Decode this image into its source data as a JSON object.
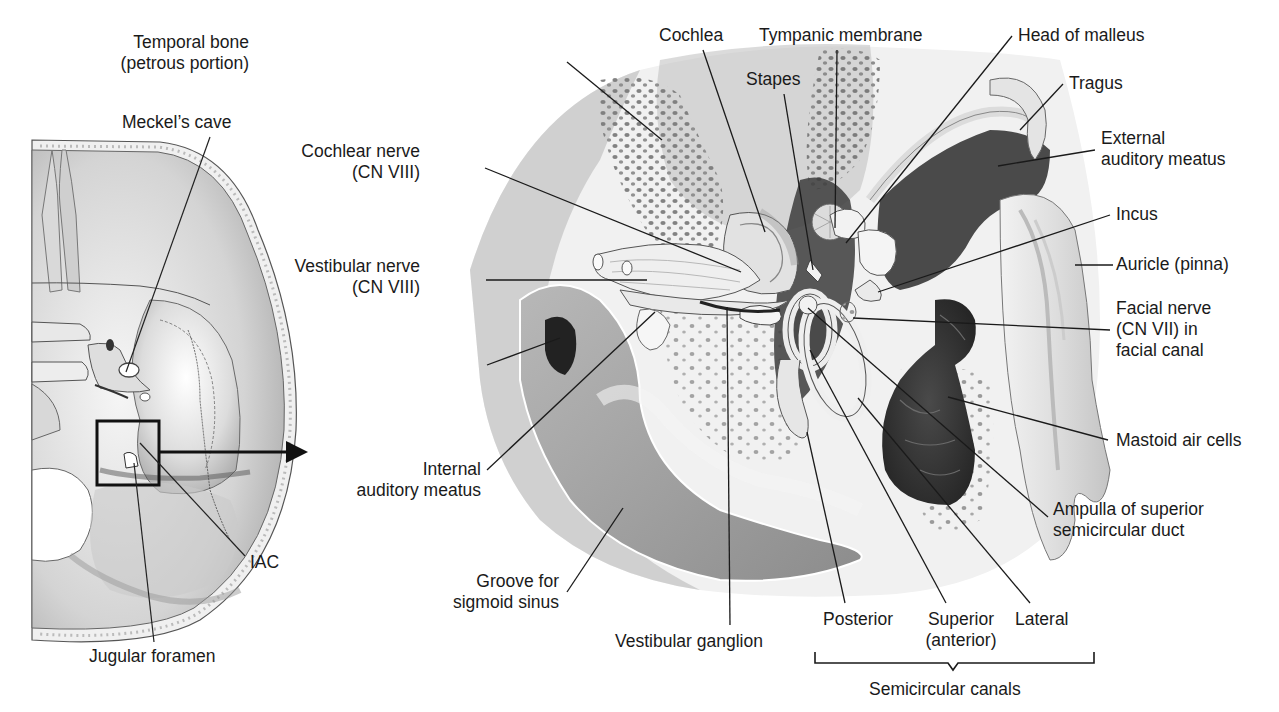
{
  "figure": {
    "inset": {
      "labels": {
        "meckels_cave": "Meckel’s cave",
        "iac": "IAC",
        "jugular_foramen": "Jugular foramen"
      }
    },
    "main": {
      "labels": {
        "temporal_bone": "Temporal bone\n(petrous portion)",
        "cochlea": "Cochlea",
        "tympanic_membrane": "Tympanic membrane",
        "head_of_malleus": "Head of malleus",
        "stapes": "Stapes",
        "tragus": "Tragus",
        "external_auditory_meatus": "External\nauditory meatus",
        "cochlear_nerve": "Cochlear nerve\n(CN VIII)",
        "incus": "Incus",
        "vestibular_nerve": "Vestibular nerve\n(CN VIII)",
        "auricle": "Auricle (pinna)",
        "facial_nerve": "Facial nerve\n(CN VII) in\nfacial canal",
        "mastoid_air_cells": "Mastoid air cells",
        "internal_auditory_meatus": "Internal\nauditory meatus",
        "ampulla": "Ampulla of superior\nsemicircular duct",
        "groove_sigmoid_sinus": "Groove for\nsigmoid sinus",
        "vestibular_ganglion": "Vestibular ganglion",
        "posterior": "Posterior",
        "superior": "Superior\n(anterior)",
        "lateral": "Lateral",
        "semicircular_canals": "Semicircular canals"
      }
    },
    "colors": {
      "ink": "#1a1a1a",
      "bone": "#e6e6e6",
      "dark_cavity": "#3a3a3a",
      "mid_gray": "#9a9a9a",
      "shadow": "#6e6e6e"
    }
  }
}
